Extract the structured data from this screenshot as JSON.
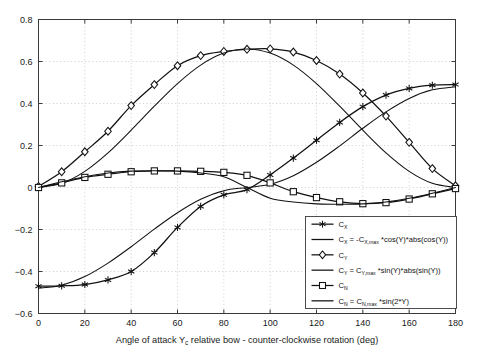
{
  "chart_data": {
    "type": "line",
    "title": "",
    "xlabel": "Angle of attack Y_c relative bow - counter-clockwise rotation (deg)",
    "xlabel_parts": {
      "pre": "Angle of attack Y",
      "sub": "c",
      "post": " relative bow - counter-clockwise rotation (deg)"
    },
    "ylabel": "",
    "xlim": [
      0,
      180
    ],
    "ylim": [
      -0.6,
      0.8
    ],
    "xticks": [
      0,
      20,
      40,
      60,
      80,
      100,
      120,
      140,
      160,
      180
    ],
    "yticks": [
      -0.6,
      -0.4,
      -0.2,
      0,
      0.2,
      0.4,
      0.6,
      0.8
    ],
    "xticklabels": [
      "0",
      "20",
      "40",
      "60",
      "80",
      "100",
      "120",
      "140",
      "160",
      "180"
    ],
    "yticklabels": [
      "-0.6",
      "-0.4",
      "-0.2",
      "0",
      "0.2",
      "0.4",
      "0.6",
      "0.8"
    ],
    "grid": true,
    "grid_style": "dotted",
    "legend_position": "lower-right",
    "line_color": "#111111",
    "x": [
      0,
      10,
      20,
      30,
      40,
      50,
      60,
      70,
      80,
      90,
      100,
      110,
      120,
      130,
      140,
      150,
      160,
      170,
      180
    ],
    "series": [
      {
        "name": "C_X",
        "label_parts": {
          "base": "C",
          "sub": "X"
        },
        "marker": "asterisk",
        "kind": "data",
        "values": [
          -0.47,
          -0.468,
          -0.462,
          -0.44,
          -0.4,
          -0.31,
          -0.19,
          -0.09,
          -0.035,
          -0.01,
          0.06,
          0.14,
          0.225,
          0.31,
          0.385,
          0.44,
          0.472,
          0.487,
          0.49
        ]
      },
      {
        "name": "C_X model",
        "label_parts": {
          "base": "C",
          "sub": "X",
          "eq": " = -C",
          "sub2": "X,max",
          "rest": " *cos(Y)*abs(cos(Y))"
        },
        "marker": "none",
        "kind": "model",
        "values": [
          -0.48,
          -0.465,
          -0.424,
          -0.36,
          -0.282,
          -0.198,
          -0.12,
          -0.056,
          -0.015,
          0.0,
          0.015,
          0.056,
          0.12,
          0.198,
          0.282,
          0.36,
          0.424,
          0.465,
          0.48
        ]
      },
      {
        "name": "C_Y",
        "label_parts": {
          "base": "C",
          "sub": "Y"
        },
        "marker": "diamond",
        "kind": "data",
        "values": [
          0.005,
          0.075,
          0.17,
          0.268,
          0.39,
          0.49,
          0.58,
          0.628,
          0.648,
          0.658,
          0.66,
          0.645,
          0.605,
          0.54,
          0.45,
          0.34,
          0.215,
          0.09,
          0.008
        ]
      },
      {
        "name": "C_Y model",
        "label_parts": {
          "base": "C",
          "sub": "Y",
          "eq": " = C",
          "sub2": "Y,max",
          "rest": " *sin(Y)*abs(sin(Y))"
        },
        "marker": "none",
        "kind": "model",
        "values": [
          0.0,
          0.02,
          0.077,
          0.165,
          0.273,
          0.387,
          0.495,
          0.583,
          0.64,
          0.66,
          0.64,
          0.583,
          0.495,
          0.387,
          0.273,
          0.165,
          0.077,
          0.02,
          0.0
        ]
      },
      {
        "name": "C_N",
        "label_parts": {
          "base": "C",
          "sub": "N"
        },
        "marker": "square",
        "kind": "data",
        "values": [
          0.0,
          0.022,
          0.048,
          0.063,
          0.075,
          0.079,
          0.079,
          0.077,
          0.072,
          0.058,
          0.022,
          -0.02,
          -0.048,
          -0.068,
          -0.077,
          -0.072,
          -0.055,
          -0.03,
          -0.005
        ]
      },
      {
        "name": "C_N model",
        "label_parts": {
          "base": "C",
          "sub": "N",
          "eq": " = C",
          "sub2": "N,max",
          "rest": " *sin(2*Y)"
        },
        "marker": "none",
        "kind": "model",
        "values": [
          0.0,
          0.027,
          0.051,
          0.069,
          0.078,
          0.08,
          0.078,
          0.069,
          0.051,
          0.0,
          -0.051,
          -0.069,
          -0.078,
          -0.08,
          -0.078,
          -0.069,
          -0.051,
          -0.027,
          0.0
        ]
      }
    ]
  },
  "legend": {
    "entries": [
      {
        "sample": "asterisk-line",
        "base": "C",
        "sub": "X",
        "tail": ""
      },
      {
        "sample": "plain-line",
        "base": "C",
        "sub": "X",
        "tail": " = -C",
        "sub2": "X,max",
        "tail2": " *cos(Y)*abs(cos(Y))"
      },
      {
        "sample": "diamond-line",
        "base": "C",
        "sub": "Y",
        "tail": ""
      },
      {
        "sample": "plain-line",
        "base": "C",
        "sub": "Y",
        "tail": " = C",
        "sub2": "Y,max",
        "tail2": " *sin(Y)*abs(sin(Y))"
      },
      {
        "sample": "square-line",
        "base": "C",
        "sub": "N",
        "tail": ""
      },
      {
        "sample": "plain-line",
        "base": "C",
        "sub": "N",
        "tail": " = C",
        "sub2": "N,max",
        "tail2": " *sin(2*Y)"
      }
    ]
  }
}
